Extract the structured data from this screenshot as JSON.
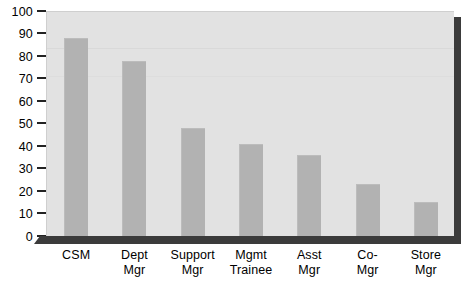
{
  "chart_data": {
    "type": "bar",
    "title": "",
    "subtitle": "",
    "xlabel": "",
    "ylabel": "",
    "ylim": [
      0,
      100
    ],
    "yticks": [
      0,
      10,
      20,
      30,
      40,
      50,
      60,
      70,
      80,
      90,
      100
    ],
    "ytick_labels": [
      "0",
      "10",
      "20",
      "30",
      "40",
      "50",
      "60",
      "70",
      "80",
      "90",
      "100"
    ],
    "grid": false,
    "legend": false,
    "legend_position": "none",
    "orientation": "vertical",
    "categories": [
      "CSM",
      "Dept Mgr",
      "Support Mgr",
      "Mgmt Trainee",
      "Asst Mgr",
      "Co- Mgr",
      "Store Mgr"
    ],
    "category_lines": [
      [
        "CSM",
        ""
      ],
      [
        "Dept",
        "Mgr"
      ],
      [
        "Support",
        "Mgr"
      ],
      [
        "Mgmt",
        "Trainee"
      ],
      [
        "Asst",
        "Mgr"
      ],
      [
        "Co-",
        "Mgr"
      ],
      [
        "Store",
        "Mgr"
      ]
    ],
    "values": [
      88,
      78,
      48,
      41,
      36,
      23,
      15
    ],
    "series": [
      {
        "name": "",
        "values": [
          88,
          78,
          48,
          41,
          36,
          23,
          15
        ]
      }
    ],
    "colors": {
      "bar": "#b2b2b2",
      "plot_background": "#e2e2e2",
      "frame_shadow": "#3b3b3b",
      "axis_text": "#000000",
      "page_background": "#ffffff"
    }
  }
}
